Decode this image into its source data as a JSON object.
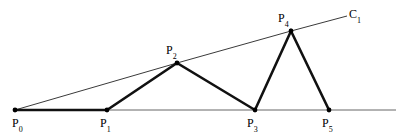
{
  "figure": {
    "title": "",
    "background_color": "#ffffff",
    "width": 411,
    "height": 138,
    "stroke_color_thick": "#1a1a1a",
    "stroke_color_thin": "#555555",
    "vertex_dot_color": "#000000"
  },
  "chart_data": {
    "type": "line",
    "title": "",
    "xlabel": "",
    "ylabel": "",
    "grid": false,
    "legend_position": "none",
    "axis_ranges": {
      "x": [
        0,
        411
      ],
      "y": [
        0,
        138
      ]
    },
    "series": [
      {
        "name": "thick-polyline",
        "style": "thick",
        "points": [
          {
            "label": "P0",
            "x": 15,
            "y": 110
          },
          {
            "label": "P1",
            "x": 107,
            "y": 110
          },
          {
            "label": "P2",
            "x": 177,
            "y": 63
          },
          {
            "label": "P3",
            "x": 255,
            "y": 110
          },
          {
            "label": "P4",
            "x": 291,
            "y": 31
          },
          {
            "label": "P5",
            "x": 329,
            "y": 110
          }
        ]
      },
      {
        "name": "C1-upper-hull",
        "style": "thin",
        "points": [
          {
            "x": 15,
            "y": 110
          },
          {
            "x": 177,
            "y": 63
          },
          {
            "x": 291,
            "y": 31
          },
          {
            "x": 347,
            "y": 16
          }
        ]
      },
      {
        "name": "baseline",
        "style": "thin",
        "points": [
          {
            "x": 15,
            "y": 110
          },
          {
            "x": 396,
            "y": 110
          }
        ]
      }
    ],
    "annotations": [
      {
        "name": "P0",
        "text": "P",
        "sub": "0",
        "x": 12,
        "y": 117
      },
      {
        "name": "P1",
        "text": "P",
        "sub": "1",
        "x": 100,
        "y": 117
      },
      {
        "name": "P2",
        "text": "P",
        "sub": "2",
        "x": 166,
        "y": 44
      },
      {
        "name": "P3",
        "text": "P",
        "sub": "3",
        "x": 247,
        "y": 117
      },
      {
        "name": "P4",
        "text": "P",
        "sub": "4",
        "x": 278,
        "y": 12
      },
      {
        "name": "P5",
        "text": "P",
        "sub": "5",
        "x": 322,
        "y": 117
      },
      {
        "name": "C1",
        "text": "C",
        "sub": "1",
        "x": 349,
        "y": 8
      }
    ]
  },
  "labels": {
    "p0": {
      "base": "P",
      "sub": "0"
    },
    "p1": {
      "base": "P",
      "sub": "1"
    },
    "p2": {
      "base": "P",
      "sub": "2"
    },
    "p3": {
      "base": "P",
      "sub": "3"
    },
    "p4": {
      "base": "P",
      "sub": "4"
    },
    "p5": {
      "base": "P",
      "sub": "5"
    },
    "c1": {
      "base": "C",
      "sub": "1"
    }
  }
}
